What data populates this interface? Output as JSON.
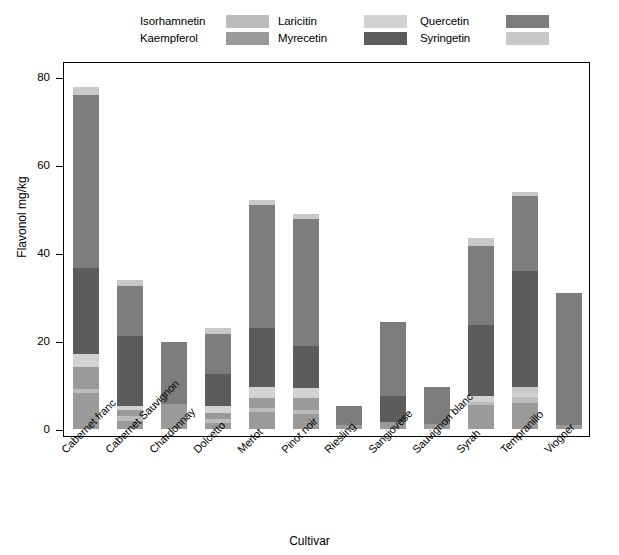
{
  "chart_data": {
    "type": "bar",
    "subtype": "stacked-bar",
    "title": "",
    "xlabel": "Cultivar",
    "ylabel": "Flavonol mg/kg",
    "ylim": [
      0,
      80
    ],
    "yticks": [
      0,
      20,
      40,
      60,
      80
    ],
    "grid": false,
    "legend_position": "top",
    "categories": [
      "Cabernet franc",
      "Cabernet Sauvignon",
      "Chardonnay",
      "Dolcetto",
      "Merlot",
      "Pinot noir",
      "Riesling",
      "Sangiovese",
      "Sauvignon blanc",
      "Syrah",
      "Tempranillo",
      "Viogner"
    ],
    "series": [
      {
        "name": "Kaempferol",
        "color": "#9a9a9a",
        "values": [
          8.0,
          2.0,
          5.6,
          4.0,
          4.0,
          4.0,
          0.8,
          1.6,
          1.2,
          5.4,
          6.0,
          1.0
        ]
      },
      {
        "name": "Isorhamnetin",
        "color": "#bcbcbc",
        "values": [
          1.0,
          1.0,
          0.0,
          1.0,
          1.0,
          1.0,
          0.0,
          0.0,
          0.0,
          1.0,
          1.2,
          0.0
        ]
      },
      {
        "name": "Laricitin",
        "color": "#d2d2d2",
        "values": [
          6.0,
          1.0,
          0.0,
          1.0,
          3.0,
          3.0,
          0.0,
          0.0,
          0.0,
          1.0,
          1.0,
          0.0
        ]
      },
      {
        "name": "Syringetin",
        "color": "#c8c8c8",
        "values": [
          3.0,
          1.2,
          0.0,
          1.2,
          1.4,
          1.5,
          0.0,
          0.0,
          0.0,
          1.6,
          1.4,
          0.0
        ]
      },
      {
        "name": "Myrecetin",
        "color": "#5c5c5c",
        "values": [
          18.0,
          16.0,
          0.0,
          6.0,
          14.0,
          9.5,
          0.0,
          6.0,
          0.0,
          16.0,
          26.0,
          0.0
        ]
      },
      {
        "name": "Quercetin",
        "color": "#7d7d7d",
        "values": [
          39.5,
          11.5,
          14.0,
          9.5,
          28.0,
          29.5,
          4.4,
          16.8,
          8.3,
          16.5,
          17.4,
          30.0
        ]
      }
    ],
    "totals": [
      77.8,
      33.8,
      19.7,
      23.0,
      52.0,
      48.9,
      5.2,
      24.4,
      9.5,
      43.5,
      53.8,
      31.0
    ],
    "stack_order_bottom_to_top": [
      "Kaempferol",
      "Isorhamnetin",
      "Laricitin",
      "Syringetin",
      "Myrecetin",
      "Quercetin"
    ],
    "bar_stacks": [
      {
        "category": "Cabernet franc",
        "segments": [
          {
            "series": "Kaempferol",
            "value": 8.2
          },
          {
            "series": "Isorhamnetin",
            "value": 0.9
          },
          {
            "series": "Kaempferol2",
            "value": 5.1
          },
          {
            "series": "Laricitin",
            "value": 2.8
          },
          {
            "series": "Myrecetin",
            "value": 19.5
          },
          {
            "series": "Quercetin",
            "value": 39.5
          },
          {
            "series": "Syringetin",
            "value": 1.8
          }
        ]
      },
      {
        "category": "Cabernet Sauvignon",
        "segments": [
          {
            "series": "Kaempferol",
            "value": 1.9
          },
          {
            "series": "Isorhamnetin",
            "value": 1.1
          },
          {
            "series": "Kaempferol2",
            "value": 1.3
          },
          {
            "series": "Laricitin",
            "value": 1.0
          },
          {
            "series": "Myrecetin",
            "value": 15.8
          },
          {
            "series": "Quercetin",
            "value": 11.4
          },
          {
            "series": "Syringetin",
            "value": 1.3
          }
        ]
      },
      {
        "category": "Chardonnay",
        "segments": [
          {
            "series": "Kaempferol",
            "value": 5.6
          },
          {
            "series": "Quercetin",
            "value": 14.1
          }
        ]
      },
      {
        "category": "Dolcetto",
        "segments": [
          {
            "series": "Kaempferol",
            "value": 1.3
          },
          {
            "series": "Isorhamnetin",
            "value": 0.9
          },
          {
            "series": "Kaempferol2",
            "value": 1.5
          },
          {
            "series": "Laricitin",
            "value": 1.5
          },
          {
            "series": "Myrecetin",
            "value": 7.2
          },
          {
            "series": "Quercetin",
            "value": 9.3
          },
          {
            "series": "Syringetin",
            "value": 1.3
          }
        ]
      },
      {
        "category": "Merlot",
        "segments": [
          {
            "series": "Kaempferol",
            "value": 3.8
          },
          {
            "series": "Isorhamnetin",
            "value": 1.0
          },
          {
            "series": "Kaempferol2",
            "value": 2.2
          },
          {
            "series": "Laricitin",
            "value": 2.5
          },
          {
            "series": "Myrecetin",
            "value": 13.5
          },
          {
            "series": "Quercetin",
            "value": 28.0
          },
          {
            "series": "Syringetin",
            "value": 1.0
          }
        ]
      },
      {
        "category": "Pinot noir",
        "segments": [
          {
            "series": "Kaempferol",
            "value": 3.5
          },
          {
            "series": "Isorhamnetin",
            "value": 0.9
          },
          {
            "series": "Kaempferol2",
            "value": 2.6
          },
          {
            "series": "Laricitin",
            "value": 2.3
          },
          {
            "series": "Myrecetin",
            "value": 9.6
          },
          {
            "series": "Quercetin",
            "value": 28.9
          },
          {
            "series": "Syringetin",
            "value": 1.1
          }
        ]
      },
      {
        "category": "Riesling",
        "segments": [
          {
            "series": "Kaempferol",
            "value": 0.8
          },
          {
            "series": "Quercetin",
            "value": 4.4
          }
        ]
      },
      {
        "category": "Sangiovese",
        "segments": [
          {
            "series": "Kaempferol",
            "value": 1.6
          },
          {
            "series": "Myrecetin",
            "value": 6.0
          },
          {
            "series": "Quercetin",
            "value": 16.8
          }
        ]
      },
      {
        "category": "Sauvignon blanc",
        "segments": [
          {
            "series": "Kaempferol",
            "value": 1.2
          },
          {
            "series": "Quercetin",
            "value": 8.3
          }
        ]
      },
      {
        "category": "Syrah",
        "segments": [
          {
            "series": "Kaempferol",
            "value": 5.4
          },
          {
            "series": "Isorhamnetin",
            "value": 0.8
          },
          {
            "series": "Laricitin",
            "value": 1.2
          },
          {
            "series": "Myrecetin",
            "value": 16.3
          },
          {
            "series": "Quercetin",
            "value": 18.0
          },
          {
            "series": "Syringetin",
            "value": 1.8
          }
        ]
      },
      {
        "category": "Tempranillo",
        "segments": [
          {
            "series": "Kaempferol",
            "value": 6.0
          },
          {
            "series": "Isorhamnetin",
            "value": 1.2
          },
          {
            "series": "Laricitin",
            "value": 1.0
          },
          {
            "series": "Syringetin",
            "value": 1.4
          },
          {
            "series": "Myrecetin",
            "value": 26.4
          },
          {
            "series": "Quercetin",
            "value": 17.0
          },
          {
            "series": "Syringetin2",
            "value": 0.8
          }
        ]
      },
      {
        "category": "Viogner",
        "segments": [
          {
            "series": "Kaempferol",
            "value": 1.0
          },
          {
            "series": "Quercetin",
            "value": 30.0
          }
        ]
      }
    ]
  },
  "legend": {
    "items": [
      {
        "label": "Isorhamnetin",
        "color": "#bcbcbc",
        "col": 0,
        "row": 0
      },
      {
        "label": "Kaempferol",
        "color": "#9a9a9a",
        "col": 0,
        "row": 1
      },
      {
        "label": "Laricitin",
        "color": "#d2d2d2",
        "col": 1,
        "row": 0
      },
      {
        "label": "Myrecetin",
        "color": "#5c5c5c",
        "col": 1,
        "row": 1
      },
      {
        "label": "Quercetin",
        "color": "#7d7d7d",
        "col": 2,
        "row": 0
      },
      {
        "label": "Syringetin",
        "color": "#c8c8c8",
        "col": 2,
        "row": 1
      }
    ]
  },
  "axes": {
    "y_label": "Flavonol mg/kg",
    "x_label": "Cultivar",
    "y_ticks": [
      "0",
      "20",
      "40",
      "60",
      "80"
    ]
  }
}
